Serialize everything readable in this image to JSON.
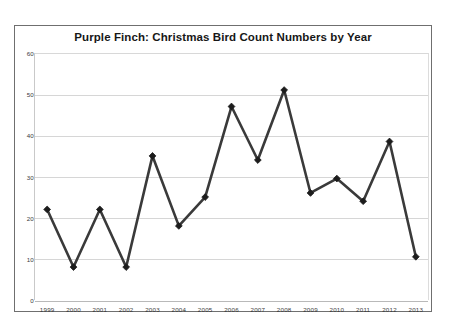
{
  "chart_data": {
    "type": "line",
    "title": "Purple Finch: Christmas Bird Count Numbers by Year",
    "xlabel": "",
    "ylabel": "",
    "categories": [
      "1999",
      "2000",
      "2001",
      "2002",
      "2003",
      "2004",
      "2005",
      "2006",
      "2007",
      "2008",
      "2009",
      "2010",
      "2011",
      "2012",
      "2013"
    ],
    "values": [
      22,
      8,
      22,
      8,
      35,
      18,
      25,
      47,
      34,
      51,
      26,
      29.5,
      24,
      38.5,
      10.5
    ],
    "series": [
      {
        "name": "Purple Finch",
        "values": [
          22,
          8,
          22,
          8,
          35,
          18,
          25,
          47,
          34,
          51,
          26,
          29.5,
          24,
          38.5,
          10.5
        ]
      }
    ],
    "ylim": [
      0,
      60
    ],
    "yticks": [
      0,
      10,
      20,
      30,
      40,
      50,
      60
    ],
    "ytick_labels": [
      "0",
      "10",
      "20",
      "30",
      "40",
      "50",
      "60"
    ],
    "grid": true,
    "grid_axis": "y",
    "legend": false,
    "legend_position": "none",
    "marker": "diamond",
    "line_color": "#3a3a3a",
    "marker_color": "#1c1c1c",
    "grid_color": "#d6d6d6",
    "plot_background": "#ffffff",
    "frame_color": "#6f6f6f",
    "line_width": 2.6,
    "annotations": []
  }
}
